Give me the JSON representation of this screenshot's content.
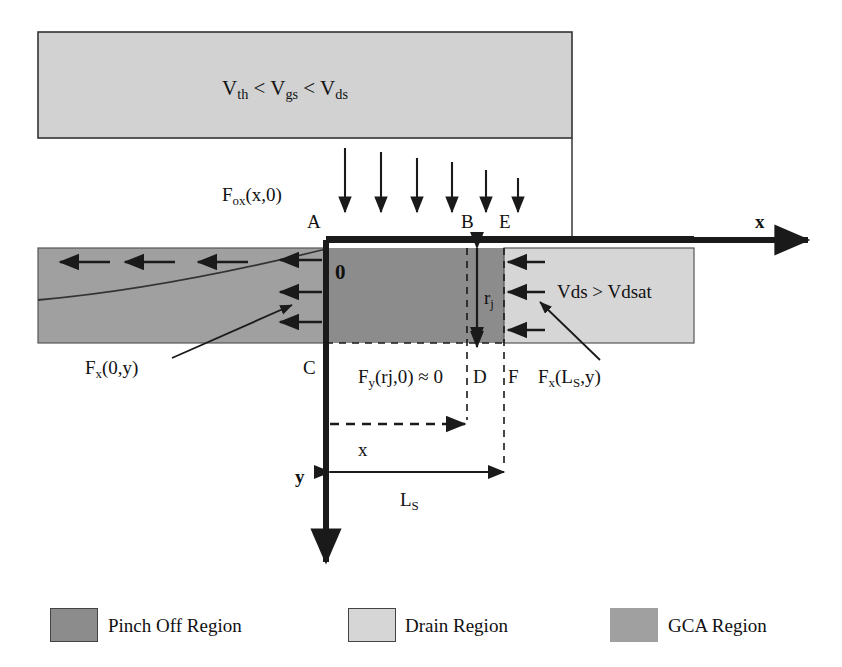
{
  "figure": {
    "type": "mosfet-cross-section-diagram",
    "title_text": ""
  },
  "colors": {
    "pinch_off": "#8c8c8c",
    "drain": "#d6d6d6",
    "gca": "#a0a0a0",
    "gate": "#d2d2d2",
    "line": "#1a1a1a"
  },
  "gate": {
    "label": "V",
    "expression_parts": {
      "v1_sub": "th",
      "op1": " < ",
      "v2_sub": "gs",
      "op2": " < ",
      "v3_sub": "ds"
    },
    "expression_plain": "Vth < Vgs < Vds"
  },
  "fields": {
    "oxide_field": {
      "base": "F",
      "sub": "ox",
      "arg": "(x,0)",
      "plain": "Fox(x,0)"
    },
    "left_field": {
      "base": "F",
      "sub": "x",
      "arg": "(0,y)",
      "plain": "Fx(0,y)"
    },
    "right_field": {
      "base": "F",
      "sub": "x",
      "arg": "(L",
      "arg_sub": "S",
      "arg_tail": ",y)",
      "plain": "Fx(LS,y)"
    },
    "vertical_field": {
      "base": "F",
      "sub": "y",
      "arg": "(rj,0) ≈ 0",
      "plain": "Fy(rj,0) ≈ 0"
    }
  },
  "drain_condition": {
    "text": "Vds > Vdsat"
  },
  "node_labels": {
    "a": "A",
    "b": "B",
    "c": "C",
    "d": "D",
    "e": "E",
    "f": "F",
    "origin": "0"
  },
  "axes": {
    "x_label": "x",
    "y_label": "y"
  },
  "dimensions": {
    "rj": {
      "base": "r",
      "sub": "j",
      "plain": "rj"
    },
    "x": {
      "plain": "x"
    },
    "ls": {
      "base": "L",
      "sub": "S",
      "plain": "LS"
    }
  },
  "legend": {
    "items": [
      {
        "label": "Pinch Off Region",
        "color": "#8c8c8c"
      },
      {
        "label": "Drain Region",
        "color": "#d6d6d6"
      },
      {
        "label": "GCA Region",
        "color": "#a0a0a0"
      }
    ]
  },
  "arrow_counts": {
    "oxide_down_arrows": 6,
    "gca_left_arrows": 3,
    "boundary_left_arrows": 3,
    "drain_left_arrows": 3
  }
}
